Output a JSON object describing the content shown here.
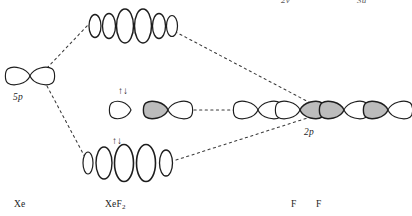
{
  "figure": {
    "type": "orbital-interaction-diagram",
    "width": 412,
    "height": 216,
    "background_color": "#ffffff",
    "stroke_color": "#1d1d1d",
    "shade_color": "#b9b9b9"
  },
  "labels": {
    "xe_5p": "5p",
    "f_2p": "2p",
    "xe_atom": "Xe",
    "xef2_molecule": "XeF",
    "xef2_subscript": "2",
    "fluorine_1": "F",
    "fluorine_2": "F",
    "top_symmetry_1": "2v",
    "top_symmetry_2": "3u"
  },
  "electron_arrows": {
    "up_glyph": "↑",
    "down_glyph": "↓",
    "middle_row_pair": "↑↓",
    "bottom_row_pair": "↑↓"
  },
  "orbital_levels": [
    {
      "name": "antibonding",
      "row": "top",
      "shape": "ellipse-chain",
      "lobe_count": 6,
      "electrons": 0,
      "center_y": 26
    },
    {
      "name": "nonbonding",
      "row": "middle",
      "shape": "p-lobe-chain",
      "lobe_count": 3,
      "electrons": 2,
      "center_y": 110
    },
    {
      "name": "bonding",
      "row": "bottom",
      "shape": "ellipse-chain",
      "lobe_count": 5,
      "electrons": 2,
      "center_y": 163
    }
  ],
  "fragment_orbitals": [
    {
      "name": "xe-5p",
      "side": "left",
      "shape": "p-orbital",
      "center_x": 30,
      "center_y": 76
    },
    {
      "name": "f-2p-left",
      "side": "right",
      "shape": "p-orbital",
      "center_x": 262,
      "center_y": 110
    },
    {
      "name": "f-2p-right",
      "side": "right",
      "shape": "p-orbital",
      "center_x": 290,
      "center_y": 110
    },
    {
      "name": "f-2p-far-left",
      "side": "right",
      "shape": "p-orbital",
      "center_x": 340,
      "center_y": 110
    },
    {
      "name": "f-2p-far-right",
      "side": "right",
      "shape": "p-orbital",
      "center_x": 380,
      "center_y": 110
    }
  ],
  "correlation_lines": [
    {
      "name": "xe-to-antibonding",
      "from": [
        46,
        68
      ],
      "to": [
        88,
        26
      ]
    },
    {
      "name": "xe-to-bonding",
      "from": [
        46,
        86
      ],
      "to": [
        86,
        160
      ]
    },
    {
      "name": "antibonding-to-f",
      "from": [
        172,
        28
      ],
      "to": [
        318,
        112
      ]
    },
    {
      "name": "middle-connector",
      "from": [
        192,
        110
      ],
      "to": [
        246,
        110
      ]
    },
    {
      "name": "bonding-to-f",
      "from": [
        178,
        160
      ],
      "to": [
        318,
        116
      ]
    }
  ]
}
